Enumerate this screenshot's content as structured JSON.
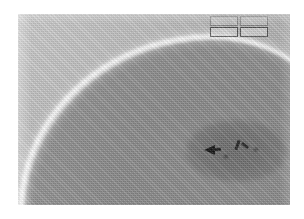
{
  "image": {
    "title": "Grayscale ultrasound scan",
    "modality": "ultrasound-b-mode",
    "frame": {
      "left": 18,
      "top": 14,
      "width": 272,
      "height": 191
    },
    "background_color": "#ffffff",
    "tones": {
      "near_field": "#c8c8c8",
      "organ_body": "#8e8e8e",
      "capsule_highlight": "#ffffff",
      "lesion": "#737373",
      "marker": "#151515"
    }
  },
  "anatomy": {
    "near_field_label": "near-field tissue plane",
    "fascial_line_label": "fascial interface line",
    "capsule_label": "bright capsule arc",
    "organ_label": "hypoechoic organ parenchyma",
    "lesion_label": "hypoechoic focal lesion"
  },
  "annotations": {
    "markers": [
      {
        "name": "arrowhead-left",
        "label": "",
        "x": 186,
        "y": 131
      },
      {
        "name": "arrowhead-right",
        "label": "",
        "x": 218,
        "y": 126
      },
      {
        "name": "marker-dot",
        "label": "",
        "x": 236,
        "y": 134
      },
      {
        "name": "marker-small",
        "label": "",
        "x": 206,
        "y": 141
      }
    ]
  },
  "param_panel": {
    "name": "scanner-parameter-readout",
    "boxes": [
      {
        "name": "param-top-left",
        "text": ""
      },
      {
        "name": "param-top-right",
        "text": ""
      },
      {
        "name": "param-bottom-left",
        "text": ""
      },
      {
        "name": "param-bottom-right",
        "text": ""
      }
    ]
  }
}
